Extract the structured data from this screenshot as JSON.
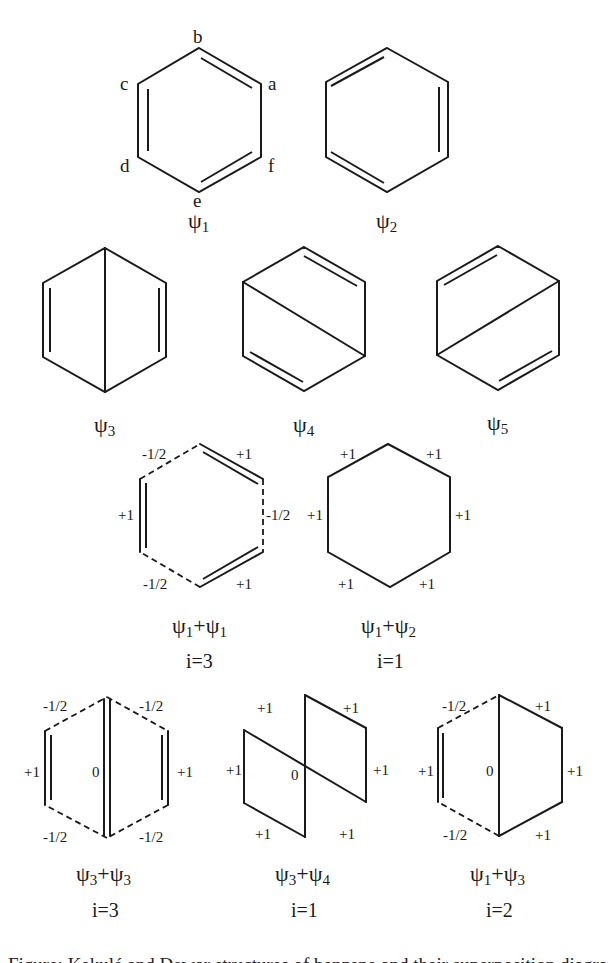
{
  "figure": {
    "atom_labels": {
      "a": "a",
      "b": "b",
      "c": "c",
      "d": "d",
      "e": "e",
      "f": "f"
    },
    "structures": [
      {
        "id": "psi1",
        "label_main": "ψ",
        "label_sub": "1"
      },
      {
        "id": "psi2",
        "label_main": "ψ",
        "label_sub": "2"
      },
      {
        "id": "psi3",
        "label_main": "ψ",
        "label_sub": "3"
      },
      {
        "id": "psi4",
        "label_main": "ψ",
        "label_sub": "4"
      },
      {
        "id": "psi5",
        "label_main": "ψ",
        "label_sub": "5"
      }
    ],
    "superpositions": [
      {
        "id": "psi1_psi1",
        "a": "ψ",
        "a_sub": "1",
        "plus": "+",
        "b": "ψ",
        "b_sub": "1",
        "islands": "i=3",
        "bond_orders": {
          "top_left": "-1/2",
          "top_right": "+1",
          "right": "-1/2",
          "bottom_right": "+1",
          "bottom_left": "-1/2",
          "left": "+1"
        }
      },
      {
        "id": "psi1_psi2",
        "a": "ψ",
        "a_sub": "1",
        "plus": "+",
        "b": "ψ",
        "b_sub": "2",
        "islands": "i=1",
        "bond_orders": {
          "top_left": "+1",
          "top_right": "+1",
          "right": "+1",
          "bottom_right": "+1",
          "bottom_left": "+1",
          "left": "+1"
        }
      },
      {
        "id": "psi3_psi3",
        "a": "ψ",
        "a_sub": "3",
        "plus": "+",
        "b": "ψ",
        "b_sub": "3",
        "islands": "i=3",
        "bond_orders": {
          "top_left": "-1/2",
          "top_right": "-1/2",
          "right": "+1",
          "bottom_right": "-1/2",
          "bottom_left": "-1/2",
          "left": "+1",
          "center": "0"
        }
      },
      {
        "id": "psi3_psi4",
        "a": "ψ",
        "a_sub": "3",
        "plus": "+",
        "b": "ψ",
        "b_sub": "4",
        "islands": "i=1",
        "bond_orders": {
          "top_left": "+1",
          "top_right": "+1",
          "right": "+1",
          "bottom_right": "+1",
          "bottom_left": "+1",
          "left": "+1",
          "center": "0"
        }
      },
      {
        "id": "psi1_psi3",
        "a": "ψ",
        "a_sub": "1",
        "plus": "+",
        "b": "ψ",
        "b_sub": "3",
        "islands": "i=2",
        "bond_orders": {
          "top_left": "-1/2",
          "top_right": "+1",
          "right": "+1",
          "bottom_right": "+1",
          "bottom_left": "-1/2",
          "left": "+1",
          "center": "0"
        }
      }
    ],
    "caption": "Figure: Kekulé and Dewar structures of benzene and their superposition diagrams"
  }
}
